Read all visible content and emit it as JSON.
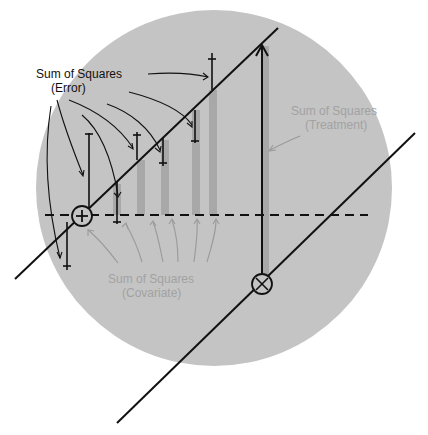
{
  "colors": {
    "background": "#ffffff",
    "circle_fill": "#c4c4c4",
    "bar_fill": "#a8a8a8",
    "line": "#111111",
    "muted_label": "#a2a2a2"
  },
  "labels": {
    "error": {
      "line1": "Sum of Squares",
      "line2": "(Error)"
    },
    "treatment": {
      "line1": "Sum of Squares",
      "line2": "(Treatment)"
    },
    "covariate": {
      "line1": "Sum of Squares",
      "line2": "(Covariate)"
    }
  },
  "markers": {
    "group1_mean": {
      "symbol": "circle-plus",
      "x": 82,
      "y": 216
    },
    "group2_mean": {
      "symbol": "circle-times",
      "x": 262,
      "y": 284
    }
  },
  "regression_lines": [
    {
      "name": "group1-regression",
      "x1": 15,
      "y1": 279,
      "x2": 278,
      "y2": 28
    },
    {
      "name": "group2-regression",
      "x1": 117,
      "y1": 423,
      "x2": 415,
      "y2": 133
    }
  ],
  "grand_mean_line": {
    "x1": 45,
    "x2": 368,
    "y": 215,
    "style": "dashed"
  },
  "error_bars": [
    {
      "x": 67,
      "top": 222,
      "bottom": 270
    },
    {
      "x": 89,
      "top": 133,
      "bottom": 209
    },
    {
      "x": 117,
      "top": 180,
      "bottom": 224
    },
    {
      "x": 138,
      "top": 136,
      "bottom": 160
    },
    {
      "x": 165,
      "top": 135,
      "bottom": 164
    },
    {
      "x": 196,
      "top": 108,
      "bottom": 141
    },
    {
      "x": 212,
      "top": 55,
      "bottom": 90
    }
  ],
  "covariate_bars": [
    {
      "x": 117,
      "top": 184,
      "bottom": 215
    },
    {
      "x": 141,
      "top": 160,
      "bottom": 215
    },
    {
      "x": 165,
      "top": 140,
      "bottom": 215
    },
    {
      "x": 196,
      "top": 110,
      "bottom": 215
    },
    {
      "x": 213,
      "top": 90,
      "bottom": 215
    }
  ],
  "treatment_arrow": {
    "x": 262,
    "y_from": 274,
    "y_to": 44
  }
}
